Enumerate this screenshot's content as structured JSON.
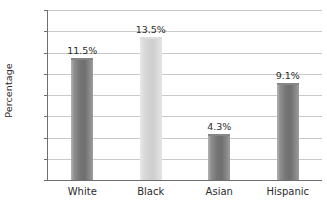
{
  "chart_data": {
    "type": "bar",
    "title": "",
    "subtitle": "",
    "xlabel": "",
    "ylabel": "Percentage",
    "categories": [
      "White",
      "Black",
      "Asian",
      "Hispanic"
    ],
    "values": [
      11.5,
      13.5,
      4.3,
      9.1
    ],
    "data_labels": [
      "11.5%",
      "13.5%",
      "4.3%",
      "9.1%"
    ],
    "ylim": [
      0,
      16
    ],
    "ytick_values": [
      0,
      2,
      4,
      6,
      8,
      10,
      12,
      14,
      16
    ],
    "ytick_labels": [
      "0",
      "2",
      "4",
      "6",
      "8",
      "10",
      "12",
      "14",
      "16"
    ],
    "grid": "horizontal",
    "legend": "none",
    "bar_styles": [
      "dark",
      "light",
      "dark",
      "dark"
    ],
    "colors": {
      "bar_dark": "#757575",
      "bar_light": "#d2d2d2",
      "gridline": "#c9c9c9",
      "axis": "#6e6e6e",
      "text": "#2b2b2b",
      "background": "#ffffff"
    }
  }
}
